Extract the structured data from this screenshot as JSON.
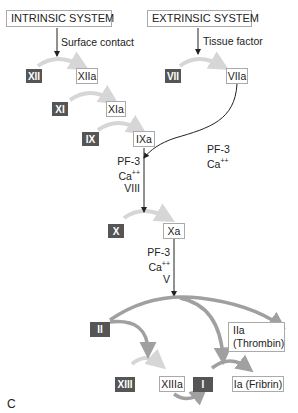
{
  "systems": {
    "intrinsic": "INTRINSIC SYSTEM",
    "extrinsic": "EXTRINSIC SYSTEM"
  },
  "triggers": {
    "intrinsic": "Surface contact",
    "extrinsic": "Tissue factor"
  },
  "factors": {
    "xii": "XII",
    "xiia": "XIIa",
    "xi": "XI",
    "xia": "XIa",
    "ix": "IX",
    "ixa": "IXa",
    "vii": "VII",
    "viia": "VIIa",
    "x": "X",
    "xa": "Xa",
    "ii": "II",
    "iia_line1": "IIa",
    "iia_line2": "(Thrombin)",
    "xiii": "XIII",
    "xiiia": "XIIIa",
    "i": "I",
    "ia": "Ia (Fribrin)"
  },
  "cofactors": {
    "extrinsic": [
      "PF-3",
      "Ca",
      "++"
    ],
    "ixa_to_x": [
      "PF-3",
      "Ca",
      "++",
      "VIII"
    ],
    "x_to_ii": [
      "PF-3",
      "Ca",
      "++",
      "V"
    ]
  },
  "panel_label": "C",
  "colors": {
    "dark_box": "#555555",
    "arrow_gray": "#a0a0a0",
    "arrow_light": "#d6d6d6",
    "line": "#222222"
  }
}
